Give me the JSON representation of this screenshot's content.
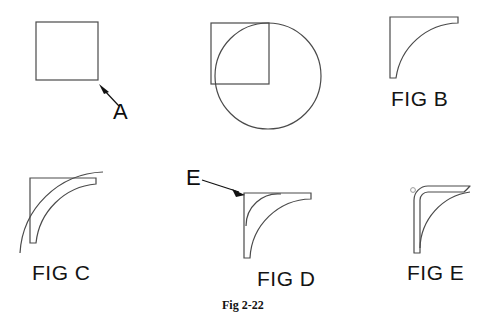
{
  "sheet": {
    "caption": "Fig 2-22",
    "background_color": "#ffffff",
    "line_color": "#4a4a4a",
    "text_color": "#111111"
  },
  "callouts": [
    {
      "name": "callout-a",
      "label": "A",
      "x": 113,
      "y": 102,
      "leader_from_x": 118,
      "leader_from_y": 105,
      "leader_to_x": 100,
      "leader_to_y": 85
    },
    {
      "name": "callout-e",
      "label": "E",
      "x": 186,
      "y": 168,
      "leader_from_x": 203,
      "leader_from_y": 180,
      "leader_to_x": 244,
      "leader_to_y": 194
    }
  ],
  "figures": [
    {
      "id": "fig-a-square",
      "label": "",
      "description": "plain square with callout A at its lower right corner",
      "shape": "square"
    },
    {
      "id": "fig-circle-square",
      "label": "",
      "description": "square overlapping a circle, circle centre at square lower right corner",
      "shape": "square-and-circle"
    },
    {
      "id": "fig-b",
      "label": "FIG B",
      "label_x": 391,
      "label_y": 88,
      "description": "right angle bracket with single concave fillet arc",
      "shape": "bracket-single-fillet"
    },
    {
      "id": "fig-c",
      "label": "FIG C",
      "label_x": 32,
      "label_y": 262,
      "description": "right angle bracket with fillet arc plus larger outer sweeping arc",
      "shape": "bracket-fillet-plus-outer-arc"
    },
    {
      "id": "fig-d",
      "label": "FIG D",
      "label_x": 257,
      "label_y": 268,
      "description": "right angle bracket with two concentric concave arcs, callout E at corner",
      "shape": "bracket-double-fillet"
    },
    {
      "id": "fig-e",
      "label": "FIG E",
      "label_x": 407,
      "label_y": 262,
      "description": "right angle bracket with rounded outer corner and concave inner arc, small circle mark",
      "shape": "bracket-rounded-outer"
    }
  ],
  "caption": {
    "text": "Fig 2-22",
    "x": 222,
    "y": 300
  }
}
